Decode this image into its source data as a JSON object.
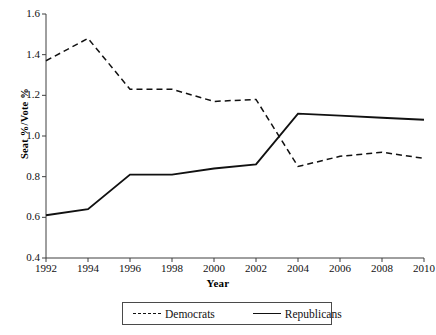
{
  "chart_data": {
    "type": "line",
    "title": "",
    "xlabel": "Year",
    "ylabel": "Seat %/Vote %",
    "x": [
      1992,
      1994,
      1996,
      1998,
      2000,
      2002,
      2004,
      2006,
      2008,
      2010
    ],
    "categories": [
      "1992",
      "1994",
      "1996",
      "1998",
      "2000",
      "2002",
      "2004",
      "2006",
      "2008",
      "2010"
    ],
    "xlim": [
      1992,
      2010
    ],
    "ylim": [
      0.4,
      1.6
    ],
    "xticks": [
      "1992",
      "1994",
      "1996",
      "1998",
      "2000",
      "2002",
      "2004",
      "2006",
      "2008",
      "2010"
    ],
    "yticks": [
      "0.4",
      "0.6",
      "0.8",
      "1.0",
      "1.2",
      "1.4",
      "1.6"
    ],
    "ytick_values": [
      0.4,
      0.6,
      0.8,
      1.0,
      1.2,
      1.4,
      1.6
    ],
    "grid": false,
    "legend_position": "bottom",
    "series": [
      {
        "name": "Democrats",
        "style": "dashed",
        "color": "#111111",
        "values": [
          1.37,
          1.48,
          1.23,
          1.23,
          1.17,
          1.18,
          0.85,
          0.9,
          0.92,
          0.89
        ]
      },
      {
        "name": "Republicans",
        "style": "solid",
        "color": "#111111",
        "values": [
          0.61,
          0.64,
          0.81,
          0.81,
          0.84,
          0.86,
          1.11,
          1.1,
          1.09,
          1.08
        ]
      }
    ]
  },
  "legend": {
    "items": [
      {
        "label": "Democrats",
        "style": "dashed"
      },
      {
        "label": "Republicans",
        "style": "solid"
      }
    ]
  },
  "axes": {
    "x_title": "Year",
    "y_title": "Seat %/Vote %"
  }
}
